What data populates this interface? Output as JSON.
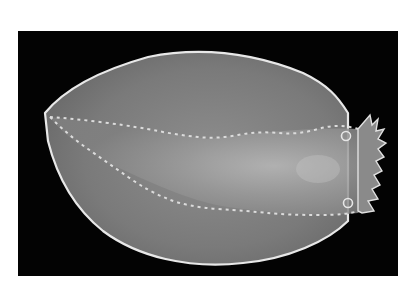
{
  "image": {
    "subject": "flatworm specimen on black background",
    "alt": "Grayscale photograph of a flattened oval sea creature with a pale scalloped margin, a central raised body with frilled edges, and a fringed head end on the right, against a black background",
    "colors": {
      "page_background": "#ffffff",
      "photo_background": "#030303",
      "body_fill": "#7c7c7c",
      "body_center": "#9a9a9a",
      "margin_highlight": "#e8e8e8",
      "frill_highlight": "#dcdcdc"
    }
  }
}
